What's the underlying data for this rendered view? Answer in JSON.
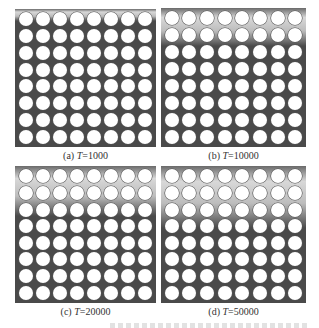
{
  "figure": {
    "grid": {
      "rows": 8,
      "cols": 8
    },
    "colors": {
      "background": "#4a4a4a",
      "holes": "#ffffff",
      "gradient_light": "#d8d8d8"
    },
    "panels": [
      {
        "id": "a",
        "prefix": "(a) ",
        "var": "T",
        "value": "=1000",
        "gradient_height": 12
      },
      {
        "id": "b",
        "prefix": "(b) ",
        "var": "T",
        "value": "=10000",
        "gradient_height": 38
      },
      {
        "id": "c",
        "prefix": "(c) ",
        "var": "T",
        "value": "=20000",
        "gradient_height": 50
      },
      {
        "id": "d",
        "prefix": "(d) ",
        "var": "T",
        "value": "=50000",
        "gradient_height": 62
      }
    ]
  }
}
